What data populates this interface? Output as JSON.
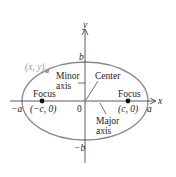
{
  "diagram": {
    "type": "ellipse",
    "colors": {
      "ellipse": "#8a8a8a",
      "axes": "#333333",
      "point": "#9a9a9a",
      "foci": "#111111",
      "text": "#222222"
    },
    "axes": {
      "x_label": "x",
      "y_label": "y"
    },
    "ticks": {
      "a_pos": "a",
      "a_neg": "−a",
      "b_pos": "b",
      "b_neg": "−b",
      "origin": "0"
    },
    "point": {
      "label": "(x, y)"
    },
    "foci": [
      {
        "title": "Focus",
        "coords": "(−c, 0)"
      },
      {
        "title": "Focus",
        "coords": "(c, 0)"
      }
    ],
    "annotations": {
      "minor_axis_line1": "Minor",
      "minor_axis_line2": "axis",
      "center": "Center",
      "major_axis_line1": "Major",
      "major_axis_line2": "axis"
    }
  }
}
